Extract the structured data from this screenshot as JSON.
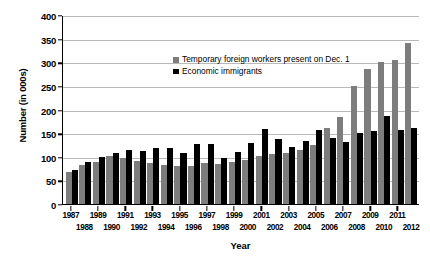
{
  "chart_data": {
    "type": "bar",
    "title": "",
    "xlabel": "Year",
    "ylabel": "Number (in 000s)",
    "ylim": [
      0,
      400
    ],
    "yticks": [
      0,
      50,
      100,
      150,
      200,
      250,
      300,
      350,
      400
    ],
    "grid": true,
    "legend_position": "upper-left-inside",
    "categories": [
      "1987",
      "1988",
      "1989",
      "1990",
      "1991",
      "1992",
      "1993",
      "1994",
      "1995",
      "1996",
      "1997",
      "1998",
      "1999",
      "2000",
      "2001",
      "2002",
      "2003",
      "2004",
      "2005",
      "2006",
      "2007",
      "2008",
      "2009",
      "2010",
      "2011",
      "2012"
    ],
    "series": [
      {
        "name": "Temporary foreign workers present on Dec. 1",
        "color": "#7d7d7d",
        "values": [
          68,
          82,
          89,
          102,
          97,
          90,
          86,
          83,
          80,
          80,
          87,
          85,
          88,
          93,
          101,
          105,
          107,
          115,
          125,
          160,
          185,
          250,
          285,
          300,
          305,
          340
        ]
      },
      {
        "name": "Economic immigrants",
        "color": "#000000",
        "values": [
          73,
          88,
          99,
          108,
          115,
          112,
          118,
          118,
          107,
          126,
          128,
          98,
          110,
          129,
          159,
          138,
          121,
          134,
          156,
          139,
          132,
          150,
          154,
          187,
          157,
          161
        ]
      }
    ]
  },
  "axis": {
    "y_title": "Number (in 000s)",
    "x_title": "Year",
    "y_tick_labels": [
      "400",
      "350",
      "300",
      "250",
      "200",
      "150",
      "100",
      "50",
      "0"
    ]
  },
  "legend": {
    "items": [
      {
        "label": "Temporary foreign workers present on Dec. 1",
        "swatch": "grey-square-icon"
      },
      {
        "label": "Economic immigrants",
        "swatch": "black-square-icon"
      }
    ]
  }
}
